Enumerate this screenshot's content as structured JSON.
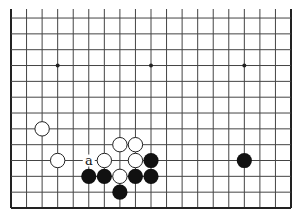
{
  "diagram": {
    "type": "go-board",
    "board_size": 19,
    "visible_lines": {
      "first_row": 7,
      "last_row": 19,
      "first_col": 1,
      "last_col": 19
    },
    "geometry": {
      "left_x": 11,
      "right_x": 291,
      "bottom_y": 208,
      "top_cut_y": 9,
      "spacing_x": 15.556,
      "spacing_y": 15.83,
      "stone_radius": 7.6
    },
    "colors": {
      "line": "#444444",
      "edge": "#222222",
      "black": "#111111",
      "white": "#ffffff",
      "white_outline": "#222222"
    },
    "star_points": [
      {
        "col": 4,
        "row": 10
      },
      {
        "col": 10,
        "row": 10
      },
      {
        "col": 16,
        "row": 10
      }
    ],
    "stones": [
      {
        "color": "white",
        "col": 3,
        "row": 14
      },
      {
        "color": "white",
        "col": 4,
        "row": 16
      },
      {
        "color": "white",
        "col": 8,
        "row": 15
      },
      {
        "color": "white",
        "col": 9,
        "row": 15
      },
      {
        "color": "white",
        "col": 7,
        "row": 16
      },
      {
        "color": "white",
        "col": 9,
        "row": 16
      },
      {
        "color": "white",
        "col": 8,
        "row": 17
      },
      {
        "color": "black",
        "col": 10,
        "row": 16
      },
      {
        "color": "black",
        "col": 16,
        "row": 16
      },
      {
        "color": "black",
        "col": 6,
        "row": 17
      },
      {
        "color": "black",
        "col": 7,
        "row": 17
      },
      {
        "color": "black",
        "col": 9,
        "row": 17
      },
      {
        "color": "black",
        "col": 10,
        "row": 17
      },
      {
        "color": "black",
        "col": 8,
        "row": 18
      }
    ],
    "labels": [
      {
        "text": "a",
        "col": 6,
        "row": 16
      }
    ]
  }
}
